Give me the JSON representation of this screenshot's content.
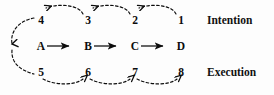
{
  "diagram": {
    "background_color": "#fdfdfd",
    "ink_color": "#0c0c0c",
    "rows": {
      "intention": {
        "label": "Intention",
        "label_x": 207,
        "label_y": 14,
        "arrow_direction": "right-to-left",
        "line_style": "dashed",
        "steps": [
          {
            "text": "4",
            "x": 33
          },
          {
            "text": "3",
            "x": 80
          },
          {
            "text": "2",
            "x": 127
          },
          {
            "text": "1",
            "x": 173
          }
        ]
      },
      "middle": {
        "arrow_direction": "left-to-right",
        "line_style": "solid",
        "steps": [
          {
            "text": "A",
            "x": 33
          },
          {
            "text": "B",
            "x": 80
          },
          {
            "text": "C",
            "x": 127
          },
          {
            "text": "D",
            "x": 173
          }
        ]
      },
      "execution": {
        "label": "Execution",
        "label_x": 207,
        "label_y": 66,
        "arrow_direction": "left-to-right",
        "line_style": "dashed",
        "steps": [
          {
            "text": "5",
            "x": 33
          },
          {
            "text": "6",
            "x": 80
          },
          {
            "text": "7",
            "x": 127
          },
          {
            "text": "8",
            "x": 173
          }
        ]
      }
    },
    "left_connector": {
      "description": "dashed curve from step 4 down to step 5",
      "direction": "downward",
      "line_style": "dashed"
    }
  }
}
